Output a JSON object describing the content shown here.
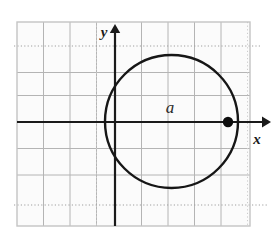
{
  "figure": {
    "title": "Circle tangent to the y-axis at the origin on a coordinate grid",
    "background_color": "#ffffff",
    "frame": {
      "border_color": "#c9c9c9",
      "x": 17,
      "y": 22,
      "width": 233,
      "height": 204
    }
  },
  "grid": {
    "spacing_px": 26.5,
    "solid_line_color": "#b4b4b4",
    "dotted_line_color": "#a8a8a8",
    "vertical_lines_x": [
      17,
      43.5,
      70,
      96.5,
      115,
      141.5,
      168,
      194.5,
      221,
      247.5
    ],
    "horizontal_lines_y": [
      22,
      46,
      72.5,
      95.5,
      122,
      148.5,
      175,
      205,
      226
    ],
    "dotted_horizontal_lines_y": [
      46,
      205
    ],
    "dotted_extends_beyond_frame": true
  },
  "axes": {
    "origin": {
      "x": 115,
      "y": 122
    },
    "color": "#1a1a1a",
    "stroke_width": 2.2,
    "x_axis": {
      "label": "x",
      "label_position": {
        "x": 256,
        "y": 142
      },
      "start_x": 17,
      "end_x": 268,
      "y": 122,
      "arrow": "right"
    },
    "y_axis": {
      "label": "y",
      "label_position": {
        "x": 104,
        "y": 36
      },
      "x": 115,
      "start_y": 226,
      "end_y": 26,
      "arrow": "up"
    }
  },
  "circle": {
    "center": {
      "x": 171.5,
      "y": 121.5
    },
    "radius": 66.5,
    "stroke_color": "#161616",
    "stroke_width": 2.4,
    "fill": "none",
    "tangent_to": "y-axis at origin",
    "region_label": "a",
    "region_label_position": {
      "x": 170,
      "y": 108
    }
  },
  "marked_point": {
    "label": "",
    "x": 228,
    "y": 122,
    "radius": 5.2,
    "fill_color": "#0d0d0d",
    "description": "filled dot at right intersection of circle and x-axis"
  }
}
